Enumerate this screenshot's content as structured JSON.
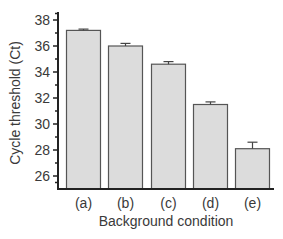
{
  "chart_data": {
    "type": "bar",
    "title": "",
    "xlabel": "Background condition",
    "ylabel": "Cycle threshold (Ct)",
    "categories": [
      "(a)",
      "(b)",
      "(c)",
      "(d)",
      "(e)"
    ],
    "values": [
      37.2,
      36.0,
      34.6,
      31.5,
      28.1
    ],
    "error": [
      0.1,
      0.2,
      0.2,
      0.2,
      0.5
    ],
    "ylim": [
      25,
      38.5
    ],
    "yticks": [
      26,
      28,
      30,
      32,
      34,
      36,
      38
    ],
    "minor_ticks": true,
    "grid": false,
    "legend": null,
    "colors": {
      "bar_fill": "#dcdcdc",
      "bar_edge": "#555555",
      "axis": "#222222"
    }
  }
}
